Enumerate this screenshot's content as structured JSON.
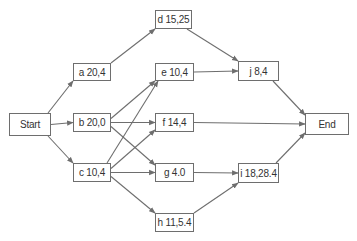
{
  "diagram": {
    "type": "activity-on-node network",
    "colors": {
      "line": "#6e6e6e",
      "text": "#333333",
      "background": "#ffffff"
    },
    "nodes": [
      {
        "id": "start",
        "label": "Start",
        "x": 9,
        "y": 113,
        "w": 42,
        "h": 23
      },
      {
        "id": "a",
        "label": "a 20,4",
        "x": 73,
        "y": 63,
        "w": 38,
        "h": 18
      },
      {
        "id": "b",
        "label": "b 20,0",
        "x": 73,
        "y": 113,
        "w": 38,
        "h": 19
      },
      {
        "id": "c",
        "label": "c 10,4",
        "x": 73,
        "y": 163,
        "w": 38,
        "h": 19
      },
      {
        "id": "d",
        "label": "d 15,25",
        "x": 155,
        "y": 10,
        "w": 37,
        "h": 19
      },
      {
        "id": "e",
        "label": "e 10,4",
        "x": 155,
        "y": 63,
        "w": 39,
        "h": 18
      },
      {
        "id": "f",
        "label": "f 14,4",
        "x": 155,
        "y": 113,
        "w": 39,
        "h": 19
      },
      {
        "id": "g",
        "label": "g 4.0",
        "x": 155,
        "y": 163,
        "w": 39,
        "h": 19
      },
      {
        "id": "h",
        "label": "h 11,5.4",
        "x": 155,
        "y": 213,
        "w": 39,
        "h": 19
      },
      {
        "id": "j",
        "label": "j 8,4",
        "x": 238,
        "y": 61,
        "w": 41,
        "h": 20
      },
      {
        "id": "i",
        "label": "i 18,28.4",
        "x": 238,
        "y": 163,
        "w": 41,
        "h": 20
      },
      {
        "id": "end",
        "label": "End",
        "x": 305,
        "y": 113,
        "w": 44,
        "h": 22
      }
    ],
    "edges": [
      {
        "from": "start",
        "to": "a"
      },
      {
        "from": "start",
        "to": "b"
      },
      {
        "from": "start",
        "to": "c"
      },
      {
        "from": "a",
        "to": "d"
      },
      {
        "from": "b",
        "to": "e"
      },
      {
        "from": "b",
        "to": "f"
      },
      {
        "from": "b",
        "to": "g"
      },
      {
        "from": "c",
        "to": "e"
      },
      {
        "from": "c",
        "to": "f"
      },
      {
        "from": "c",
        "to": "g"
      },
      {
        "from": "c",
        "to": "h"
      },
      {
        "from": "d",
        "to": "j"
      },
      {
        "from": "e",
        "to": "j"
      },
      {
        "from": "f",
        "to": "end"
      },
      {
        "from": "g",
        "to": "i"
      },
      {
        "from": "h",
        "to": "i"
      },
      {
        "from": "j",
        "to": "end"
      },
      {
        "from": "i",
        "to": "end"
      }
    ]
  }
}
